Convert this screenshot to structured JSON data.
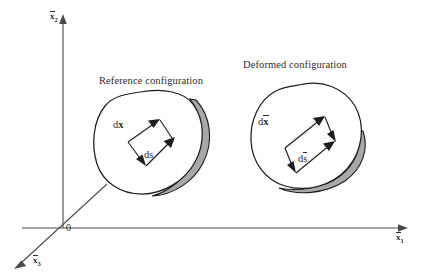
{
  "figure": {
    "kind": "continuum-mechanics-deformation-diagram",
    "background_color": "#ffffff",
    "line_color": "#1d1d1d",
    "axis_color": "#4a4a4a",
    "shadow_color": "#a8a8a8"
  },
  "axes": {
    "origin_label": "0",
    "vertical": {
      "name": "x2-axis",
      "base": "x",
      "subscript": "2",
      "overbar": true
    },
    "horizontal": {
      "name": "x1-axis",
      "base": "x",
      "subscript": "1",
      "overbar": true
    },
    "depth": {
      "name": "x3-axis",
      "base": "x",
      "subscript": "3",
      "overbar": true
    }
  },
  "bodies": [
    {
      "id": "reference",
      "caption": "Reference configuration",
      "vectors": [
        {
          "id": "dx",
          "label_base": "d",
          "label_sym": "x",
          "overbar": false,
          "bold_symbol": true
        },
        {
          "id": "ds",
          "label_base": "d",
          "label_sym": "s",
          "overbar": false,
          "bold_symbol": false
        }
      ]
    },
    {
      "id": "deformed",
      "caption": "Deformed configuration",
      "vectors": [
        {
          "id": "dxbar",
          "label_base": "d",
          "label_sym": "x",
          "overbar": true,
          "bold_symbol": true
        },
        {
          "id": "dsbar",
          "label_base": "d",
          "label_sym": "s",
          "overbar": true,
          "bold_symbol": false
        }
      ]
    }
  ],
  "labels": {
    "reference_caption": "Reference configuration",
    "deformed_caption": "Deformed configuration",
    "origin": "0",
    "axis_x1_base": "x",
    "axis_x1_sub": "1",
    "axis_x2_base": "x",
    "axis_x2_sub": "2",
    "axis_x3_base": "x",
    "axis_x3_sub": "3",
    "dx_d": "d",
    "dx_sym": "x",
    "ds_d": "d",
    "ds_sym": "s",
    "dxbar_d": "d",
    "dxbar_sym": "x",
    "dsbar_d": "d",
    "dsbar_sym": "s"
  }
}
